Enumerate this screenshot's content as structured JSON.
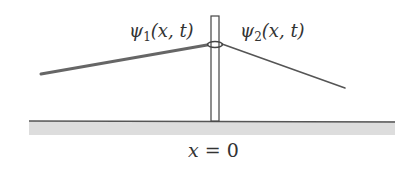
{
  "figure": {
    "labels": {
      "left_wave": {
        "symbol": "ψ",
        "subscript": "1",
        "args": "(x, t)"
      },
      "right_wave": {
        "symbol": "ψ",
        "subscript": "2",
        "args": "(x, t)"
      },
      "boundary": {
        "variable": "x",
        "equals": "=",
        "value": "0"
      }
    },
    "colors": {
      "rope": "#555555",
      "pole": "#444444",
      "ground_line": "#555555",
      "ground_fill": "#dddddd",
      "text": "#333333"
    }
  }
}
